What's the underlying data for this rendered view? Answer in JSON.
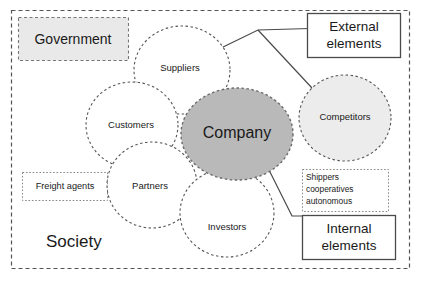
{
  "diagram": {
    "colors": {
      "outer_boundary_stroke": "#555555",
      "circle_stroke": "#555555",
      "company_fill": "#b9b9b9",
      "company_stroke": "#6b6b6b",
      "competitors_fill": "#ececec",
      "government_fill": "#e9e9e9",
      "box_stroke": "#4a4a4a",
      "connector_stroke": "#4a4a4a",
      "text": "#1a1a1a",
      "page_background": "#ffffff"
    },
    "outer_region": {
      "label": "Society",
      "border_style": "dashed"
    },
    "circles": [
      {
        "key": "suppliers",
        "label": "Suppliers",
        "fill": "none",
        "border_style": "dashed"
      },
      {
        "key": "customers",
        "label": "Customers",
        "fill": "none",
        "border_style": "dashed"
      },
      {
        "key": "partners",
        "label": "Partners",
        "fill": "none",
        "border_style": "dashed"
      },
      {
        "key": "investors",
        "label": "Investors",
        "fill": "none",
        "border_style": "dashed"
      },
      {
        "key": "competitors",
        "label": "Competitors",
        "fill": "#ececec",
        "border_style": "dashed"
      },
      {
        "key": "company",
        "label": "Company",
        "fill": "#b9b9b9",
        "border_style": "dashed"
      }
    ],
    "boxes": [
      {
        "key": "government",
        "label": "Government",
        "border_style": "dashed",
        "fill": "#e9e9e9",
        "align": "center"
      },
      {
        "key": "freight-agents",
        "label": "Freight agents",
        "border_style": "dotted",
        "fill": "none",
        "align": "center"
      },
      {
        "key": "external-elements",
        "label_line1": "External",
        "label_line2": "elements",
        "border_style": "solid",
        "fill": "#ffffff",
        "align": "center"
      },
      {
        "key": "internal-elements",
        "label_line1": "Internal",
        "label_line2": "elements",
        "border_style": "solid",
        "fill": "#ffffff",
        "align": "center"
      },
      {
        "key": "shippers-note",
        "label_line1": "Shippers",
        "label_line2": "cooperatives",
        "label_line3": "autonomous",
        "border_style": "dotted",
        "fill": "none",
        "align": "left"
      }
    ],
    "connectors": [
      {
        "key": "external-to-suppliers",
        "from": "external-elements",
        "to": "suppliers"
      },
      {
        "key": "external-to-competitors",
        "from": "external-elements",
        "to": "competitors"
      },
      {
        "key": "internal-to-company",
        "from": "internal-elements",
        "to": "company"
      }
    ]
  }
}
